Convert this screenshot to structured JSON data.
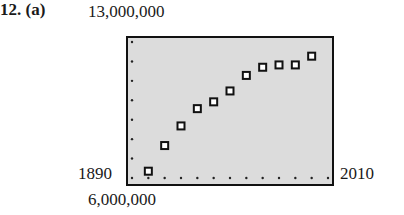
{
  "problem": {
    "number": "12.",
    "part": "(a)"
  },
  "window": {
    "ymax_label": "13,000,000",
    "ymin_label": "6,000,000",
    "xmin_label": "1890",
    "xmax_label": "2010"
  },
  "chart_data": {
    "type": "scatter",
    "title": "",
    "xlabel": "",
    "ylabel": "",
    "xlim": [
      1890,
      2010
    ],
    "ylim": [
      6000000,
      13000000
    ],
    "x_tick_step": 10,
    "y_tick_step": 1000000,
    "grid": false,
    "marker": "hollow-square",
    "x": [
      1900,
      1910,
      1920,
      1930,
      1940,
      1950,
      1960,
      1970,
      1980,
      1990,
      2000
    ],
    "y": [
      6350000,
      7670000,
      8680000,
      9570000,
      9920000,
      10480000,
      11280000,
      11700000,
      11820000,
      11820000,
      12270000
    ]
  }
}
